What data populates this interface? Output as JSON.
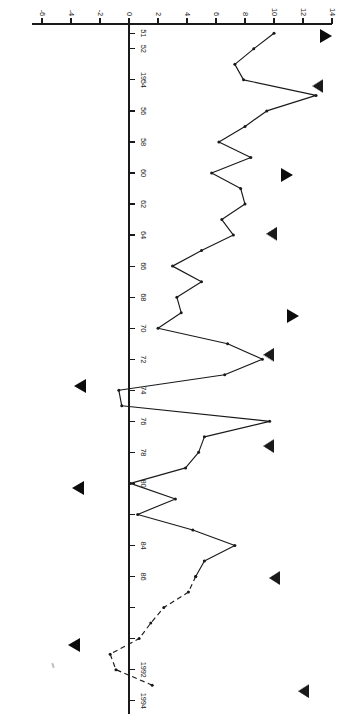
{
  "chart_data": {
    "type": "line",
    "title": "",
    "subtitle": "",
    "xlabel": "",
    "ylabel": "",
    "orientation": "rotated-90-ccw",
    "grid": false,
    "legend": "none",
    "xlim": [
      1950.4,
      1994.6
    ],
    "ylim": [
      -6,
      14
    ],
    "x_tick_labels": [
      "51",
      "52",
      "1954",
      "56",
      "58",
      "60",
      "62",
      "64",
      "66",
      "68",
      "70",
      "72",
      "74",
      "76",
      "78",
      "80",
      "84",
      "86",
      "1992",
      "1994"
    ],
    "x_tick_values": [
      1951,
      1952,
      1954,
      1956,
      1958,
      1960,
      1962,
      1964,
      1966,
      1968,
      1970,
      1972,
      1974,
      1976,
      1978,
      1980,
      1984,
      1986,
      1992,
      1994
    ],
    "x_tick_values_all": [
      1951,
      1952,
      1954,
      1956,
      1958,
      1960,
      1962,
      1964,
      1966,
      1968,
      1970,
      1972,
      1974,
      1976,
      1978,
      1980,
      1982,
      1984,
      1986,
      1988,
      1990,
      1992,
      1994
    ],
    "y_tick_labels": [
      "14",
      "12",
      "10",
      "8",
      "6",
      "4",
      "2",
      "0",
      "-2",
      "-4",
      "-6"
    ],
    "y_tick_values": [
      14,
      12,
      10,
      8,
      6,
      4,
      2,
      0,
      -2,
      -4,
      -6
    ],
    "zero_line": 0,
    "series": [
      {
        "name": "annual-rate-solid",
        "style": "solid",
        "marker": "dot",
        "x": [
          1951,
          1952,
          1953,
          1954,
          1955,
          1956,
          1957,
          1958,
          1959,
          1960,
          1961,
          1962,
          1963,
          1964,
          1965,
          1966,
          1967,
          1968,
          1969,
          1970,
          1971,
          1972,
          1973,
          1974,
          1975,
          1976,
          1977,
          1978,
          1979,
          1980,
          1981,
          1982,
          1983,
          1984,
          1985,
          1986
        ],
        "values": [
          10.0,
          8.6,
          7.3,
          7.9,
          12.9,
          9.5,
          8.0,
          6.2,
          8.4,
          5.7,
          7.7,
          8.0,
          6.4,
          7.2,
          5.0,
          3.0,
          5.0,
          3.3,
          3.6,
          2.0,
          6.8,
          9.2,
          6.6,
          -0.7,
          -0.5,
          9.7,
          5.2,
          4.8,
          3.9,
          0.1,
          3.2,
          0.6,
          4.4,
          7.3,
          5.2,
          4.6
        ]
      },
      {
        "name": "annual-rate-dashed",
        "style": "dashed",
        "marker": "dot",
        "x": [
          1986,
          1987,
          1988,
          1989,
          1990,
          1991,
          1992,
          1993
        ],
        "values": [
          4.6,
          4.1,
          2.4,
          1.5,
          0.7,
          -1.3,
          -0.9,
          1.6
        ]
      }
    ],
    "annotations": [
      {
        "name": "peak-marker",
        "symbol": "filled-triangle-up",
        "x": 1951.2,
        "y": 13.6
      },
      {
        "name": "trough-marker",
        "symbol": "open-triangle-down",
        "x": 1954.4,
        "y": 13.0
      },
      {
        "name": "peak-marker",
        "symbol": "filled-triangle-up",
        "x": 1960.1,
        "y": 10.9
      },
      {
        "name": "trough-marker",
        "symbol": "open-triangle-down",
        "x": 1963.9,
        "y": 9.8
      },
      {
        "name": "peak-marker",
        "symbol": "filled-triangle-up",
        "x": 1969.2,
        "y": 11.3
      },
      {
        "name": "trough-marker",
        "symbol": "open-triangle-down",
        "x": 1971.7,
        "y": 9.6
      },
      {
        "name": "peak-marker",
        "symbol": "filled-triangle-down",
        "x": 1973.7,
        "y": -3.4
      },
      {
        "name": "trough-marker",
        "symbol": "open-triangle-down",
        "x": 1977.6,
        "y": 9.6
      },
      {
        "name": "peak-marker",
        "symbol": "filled-triangle-down",
        "x": 1980.3,
        "y": -3.5
      },
      {
        "name": "trough-marker",
        "symbol": "open-triangle-down",
        "x": 1986.1,
        "y": 10.0
      },
      {
        "name": "peak-marker",
        "symbol": "filled-triangle-down",
        "x": 1990.4,
        "y": -3.8
      },
      {
        "name": "trough-marker",
        "symbol": "open-triangle-down",
        "x": 1993.4,
        "y": 12.0
      }
    ],
    "ink_speck": {
      "x": 1991.6,
      "y": -5.2
    }
  },
  "colors": {
    "ink": "#1a1a1a",
    "line": "#1a1a1a",
    "marker_fill": "#0c0c0c",
    "marker_open": "#ffffff",
    "background": "#ffffff"
  }
}
